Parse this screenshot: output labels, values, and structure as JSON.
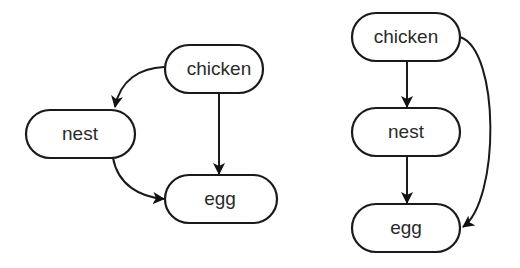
{
  "graphs": [
    {
      "name": "left-graph",
      "nodes": [
        {
          "id": "chicken",
          "label": "chicken"
        },
        {
          "id": "nest",
          "label": "nest"
        },
        {
          "id": "egg",
          "label": "egg"
        }
      ],
      "edges": [
        {
          "from": "chicken",
          "to": "nest",
          "style": "curved"
        },
        {
          "from": "chicken",
          "to": "egg",
          "style": "straight"
        },
        {
          "from": "nest",
          "to": "egg",
          "style": "curved"
        }
      ]
    },
    {
      "name": "right-graph",
      "nodes": [
        {
          "id": "chicken",
          "label": "chicken"
        },
        {
          "id": "nest",
          "label": "nest"
        },
        {
          "id": "egg",
          "label": "egg"
        }
      ],
      "edges": [
        {
          "from": "chicken",
          "to": "nest",
          "style": "straight"
        },
        {
          "from": "nest",
          "to": "egg",
          "style": "straight"
        },
        {
          "from": "chicken",
          "to": "egg",
          "style": "curved"
        }
      ]
    }
  ],
  "colors": {
    "stroke": "#1a1a1a",
    "fill": "#ffffff",
    "text": "#2a2a2a"
  }
}
